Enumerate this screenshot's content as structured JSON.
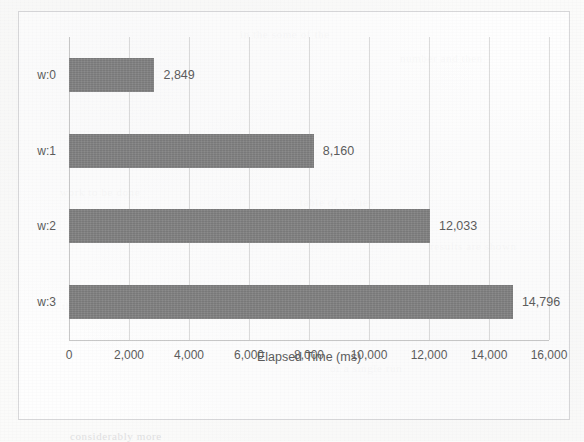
{
  "chart_data": {
    "type": "bar",
    "orientation": "horizontal",
    "title": "",
    "xlabel": "Elapsed Time (ms)",
    "ylabel": "",
    "categories": [
      "w:0",
      "w:1",
      "w:2",
      "w:3"
    ],
    "values": [
      2849,
      8160,
      12033,
      14796
    ],
    "value_labels": [
      "2,849",
      "8,160",
      "12,033",
      "14,796"
    ],
    "xlim": [
      0,
      16000
    ],
    "xticks": [
      0,
      2000,
      4000,
      6000,
      8000,
      10000,
      12000,
      14000,
      16000
    ],
    "xtick_labels": [
      "0",
      "2,000",
      "4,000",
      "6,000",
      "8,000",
      "10,000",
      "12,000",
      "14,000",
      "16,000"
    ],
    "grid": "vertical",
    "legend": "none",
    "colors": {
      "bar": "#808080",
      "text": "#5a5a5a",
      "gridline": "#dcdcdc",
      "border": "#d8d8da",
      "background": "#ffffff"
    }
  },
  "bleed_text": {
    "t1": "in the some of the",
    "t2": "number and then",
    "t3": "work to be done",
    "t4": "table of values",
    "t5": "results are shown",
    "t6": "the elapsed time",
    "t7": "of a single run",
    "t8": "considerably more"
  }
}
